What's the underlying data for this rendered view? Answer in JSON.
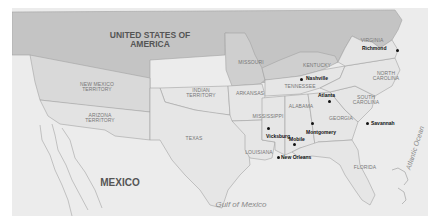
{
  "map": {
    "title": "Confederate States and surrounding regions",
    "colors": {
      "union": "#c4c4c4",
      "confederacy": "#e6e6e6",
      "territory": "#d9d9d9",
      "border_state": "#cfcfcf",
      "foreign": "#ececec",
      "water": "#ececec",
      "border": "#a3a3a3"
    },
    "regions": {
      "usa": "UNITED STATES OF\nAMERICA",
      "mexico": "MEXICO",
      "new_mexico": "NEW MEXICO\nTERRITORY",
      "arizona": "ARIZONA\nTERRITORY",
      "indian": "INDIAN\nTERRITORY",
      "texas": "TEXAS",
      "missouri": "MISSOURI",
      "arkansas": "ARKANSAS",
      "kentucky": "KENTUCKY",
      "tennessee": "TENNESSEE",
      "virginia": "VIRGINIA",
      "north_carolina": "NORTH\nCAROLINA",
      "south_carolina": "SOUTH\nCAROLINA",
      "georgia": "GEORGIA",
      "alabama": "ALABAMA",
      "mississippi": "MISSISSIPPI",
      "louisiana": "LOUISIANA",
      "florida": "FLORIDA"
    },
    "water": {
      "gulf": "Gulf of Mexico",
      "atlantic": "Atlantic Ocean"
    },
    "cities": [
      {
        "name": "Richmond"
      },
      {
        "name": "Nashville"
      },
      {
        "name": "Atlanta"
      },
      {
        "name": "Savannah"
      },
      {
        "name": "Montgomery"
      },
      {
        "name": "Vicksburg"
      },
      {
        "name": "Mobile"
      },
      {
        "name": "New Orleans"
      }
    ]
  }
}
